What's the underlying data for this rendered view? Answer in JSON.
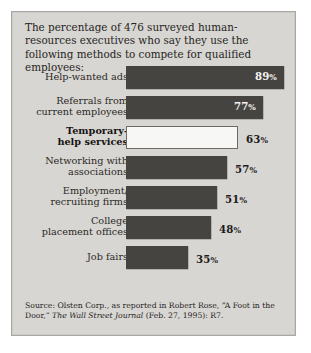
{
  "headline": "The percentage of 476 surveyed human-resources executives who say they use the following methods to compete for qualified employees:",
  "source": {
    "lead": "Source: Olsten Corp., as reported in Robert Rose, “A Foot in the Door,”",
    "publication": "The Wall Street Journal",
    "trailing": " (Feb. 27, 1995): R7."
  },
  "colors": {
    "panel_background": "#d8d6d2",
    "panel_border": "#a9a7a3",
    "bar_fill": "#464441",
    "bar_hollow_fill": "#f7f7f5",
    "bar_hollow_border": "#6d6b67",
    "label_inside": "#f4f3f1",
    "label_outside": "#1d1c1b",
    "text": "#262523"
  },
  "chart_data": {
    "type": "bar",
    "orientation": "horizontal",
    "title": "The percentage of 476 surveyed human-resources executives who say they use the following methods to compete for qualified employees:",
    "xlabel": "",
    "ylabel": "",
    "xlim": [
      0,
      100
    ],
    "grid": false,
    "legend": false,
    "value_suffix": "%",
    "sample_size": 476,
    "categories": [
      "Help-wanted ads",
      "Referrals from current employees",
      "Temporary-help services",
      "Networking with associations",
      "Employment/ recruiting firms",
      "College placement offices",
      "Job fairs"
    ],
    "values": [
      89,
      77,
      63,
      57,
      51,
      48,
      35
    ],
    "bars": [
      {
        "label_line1": "Help-wanted ads",
        "label_line2": "",
        "value": 89,
        "value_text": "89",
        "suffix": "%",
        "style": "filled",
        "label_position": "inside",
        "emphasis": false
      },
      {
        "label_line1": "Referrals from",
        "label_line2": "current employees",
        "value": 77,
        "value_text": "77",
        "suffix": "%",
        "style": "filled",
        "label_position": "inside",
        "emphasis": false
      },
      {
        "label_line1": "Temporary-",
        "label_line2": "help services",
        "value": 63,
        "value_text": "63",
        "suffix": "%",
        "style": "hollow",
        "label_position": "outside",
        "emphasis": true
      },
      {
        "label_line1": "Networking with",
        "label_line2": "associations",
        "value": 57,
        "value_text": "57",
        "suffix": "%",
        "style": "filled",
        "label_position": "outside",
        "emphasis": false
      },
      {
        "label_line1": "Employment/",
        "label_line2": "recruiting firms",
        "value": 51,
        "value_text": "51",
        "suffix": "%",
        "style": "filled",
        "label_position": "outside",
        "emphasis": false
      },
      {
        "label_line1": "College",
        "label_line2": "placement offices",
        "value": 48,
        "value_text": "48",
        "suffix": "%",
        "style": "filled",
        "label_position": "outside",
        "emphasis": false
      },
      {
        "label_line1": "Job fairs",
        "label_line2": "",
        "value": 35,
        "value_text": "35",
        "suffix": "%",
        "style": "filled",
        "label_position": "outside",
        "emphasis": false
      }
    ]
  }
}
